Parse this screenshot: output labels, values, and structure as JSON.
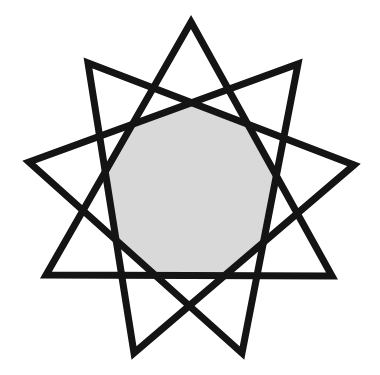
{
  "figure": {
    "title": "Nine-pointed star {9/3} formed by three overlapping equilateral triangles with shaded central nonagon",
    "star_type": "{9/3}",
    "points": 9,
    "vertices": [
      {
        "name": "top",
        "x": 191,
        "y": 22
      },
      {
        "name": "upper-right",
        "x": 298,
        "y": 64
      },
      {
        "name": "right",
        "x": 354,
        "y": 165
      },
      {
        "name": "lower-right",
        "x": 332,
        "y": 276
      },
      {
        "name": "bottom-right",
        "x": 242,
        "y": 353
      },
      {
        "name": "bottom-left",
        "x": 134,
        "y": 353
      },
      {
        "name": "lower-left",
        "x": 46,
        "y": 275
      },
      {
        "name": "left",
        "x": 29,
        "y": 162
      },
      {
        "name": "upper-left",
        "x": 88,
        "y": 63
      }
    ],
    "triangles": [
      {
        "name": "triangle-a",
        "points": "191,22 332,276 46,275"
      },
      {
        "name": "triangle-b",
        "points": "298,64 242,353 29,162"
      },
      {
        "name": "triangle-c",
        "points": "354,165 134,353 88,63"
      }
    ],
    "colors": {
      "stroke": "#141414",
      "center_fill": "#d9d9d9",
      "background": "#ffffff"
    },
    "shaded_region": "central nonagon"
  }
}
